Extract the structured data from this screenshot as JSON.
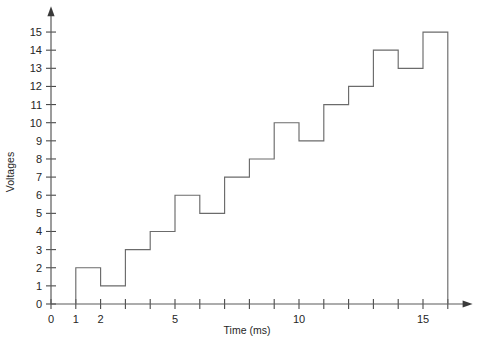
{
  "chart_data": {
    "type": "line",
    "subtype": "step",
    "title": "",
    "xlabel": "Time (ms)",
    "ylabel": "Voltages",
    "xlim": [
      0,
      16.8
    ],
    "ylim": [
      0,
      15.6
    ],
    "grid": false,
    "legend": null,
    "x_tick_values": [
      0,
      1,
      2,
      3,
      4,
      5,
      6,
      7,
      8,
      9,
      10,
      11,
      12,
      13,
      14,
      15,
      16
    ],
    "x_tick_labels": [
      "0",
      "1",
      "2",
      "",
      "",
      "5",
      "",
      "",
      "",
      "",
      "10",
      "",
      "",
      "",
      "",
      "15",
      ""
    ],
    "y_tick_values": [
      0,
      1,
      2,
      3,
      4,
      5,
      6,
      7,
      8,
      9,
      10,
      11,
      12,
      13,
      14,
      15
    ],
    "y_tick_labels": [
      "0",
      "1",
      "2",
      "3",
      "4",
      "5",
      "6",
      "7",
      "8",
      "9",
      "10",
      "11",
      "12",
      "13",
      "14",
      "15"
    ],
    "step_start": 1,
    "step_width": 1,
    "values": [
      2,
      1,
      3,
      4,
      6,
      5,
      7,
      8,
      10,
      9,
      11,
      12,
      14,
      13,
      15
    ],
    "x_intervals": [
      [
        1,
        2
      ],
      [
        2,
        3
      ],
      [
        3,
        4
      ],
      [
        4,
        5
      ],
      [
        5,
        6
      ],
      [
        6,
        7
      ],
      [
        7,
        8
      ],
      [
        8,
        9
      ],
      [
        9,
        10
      ],
      [
        10,
        11
      ],
      [
        11,
        12
      ],
      [
        12,
        13
      ],
      [
        13,
        14
      ],
      [
        14,
        15
      ],
      [
        15,
        16
      ]
    ],
    "line_color": "#6b6b6b",
    "axis_color": "#5a5a5a",
    "text_color": "#262626",
    "background_color": "#ffffff"
  }
}
